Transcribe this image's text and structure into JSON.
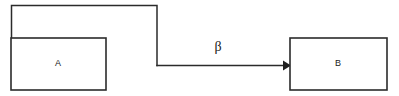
{
  "diagram": {
    "type": "block-diagram",
    "background_color": "#ffffff",
    "line_color": "#2b2b2b",
    "text_color": "#1a1a1a",
    "blocks": [
      {
        "id": "block-a",
        "label": "A",
        "x": 11,
        "y": 38,
        "width": 95,
        "height": 52,
        "label_x": 58,
        "label_y": 64
      },
      {
        "id": "block-b",
        "label": "B",
        "x": 290,
        "y": 38,
        "width": 97,
        "height": 52,
        "label_x": 338,
        "label_y": 64
      }
    ],
    "connections": [
      {
        "id": "feedback-path",
        "from": "block-a",
        "to": "forward-arrow",
        "label": "",
        "path": "M 11.5 38 L 11.5 5.5 L 157 5.5 L 157 65.5"
      },
      {
        "id": "forward-arrow",
        "from": "feedback-path",
        "to": "block-b",
        "label": "β",
        "label_x": 218,
        "label_y": 48,
        "path": "M 157 65.5 L 283 65.5",
        "arrow_head": "283,60.5 291,65.5 283,70.5"
      }
    ]
  }
}
